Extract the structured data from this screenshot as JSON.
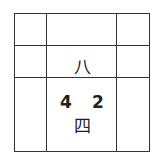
{
  "grid": {
    "rows": 3,
    "cols": 3,
    "cells": [
      [
        "",
        "",
        ""
      ],
      [
        "",
        "八",
        ""
      ],
      [
        "",
        "4 2 四",
        ""
      ]
    ]
  },
  "labels": {
    "top": "八",
    "num_left": "4",
    "num_right": "2",
    "bottom": "四"
  },
  "colors": {
    "line": "#333333",
    "text": "#222222",
    "background": "#ffffff"
  }
}
